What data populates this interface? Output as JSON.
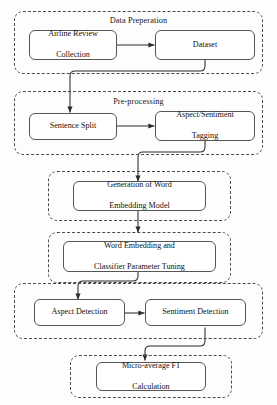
{
  "diagram": {
    "type": "flowchart",
    "orientation": "top-to-bottom",
    "groups": [
      {
        "id": "data-preparation",
        "label": "Data Preperation"
      },
      {
        "id": "pre-processing",
        "label": "Pre-processing"
      },
      {
        "id": "word-embedding-generation",
        "label": ""
      },
      {
        "id": "parameter-tuning",
        "label": ""
      },
      {
        "id": "detection",
        "label": ""
      },
      {
        "id": "evaluation",
        "label": ""
      }
    ],
    "nodes": [
      {
        "id": "airline-review-collection",
        "label": "Airline Review\nCollection",
        "line1": "Airline Review",
        "line2": "Collection"
      },
      {
        "id": "dataset",
        "label": "Dataset",
        "line1": "Dataset",
        "line2": ""
      },
      {
        "id": "sentence-split",
        "label": "Sentence Split",
        "line1": "Sentence Split",
        "line2": ""
      },
      {
        "id": "aspect-sentiment-tagging",
        "label": "Aspect/Sentiment Tagging",
        "line1": "Aspect/Sentiment",
        "line2": "Tagging"
      },
      {
        "id": "word-embedding-model",
        "label": "Generation of Word Embedding Model",
        "line1": "Generation of Word",
        "line2": "Embedding Model"
      },
      {
        "id": "classifier-parameter-tuning",
        "label": "Word Embedding and Classifier Parameter Tuning",
        "line1": "Word Embedding and",
        "line2": "Classifier Parameter Tuning"
      },
      {
        "id": "aspect-detection",
        "label": "Aspect Detection",
        "line1": "Aspect Detection",
        "line2": ""
      },
      {
        "id": "sentiment-detection",
        "label": "Sentiment Detection",
        "line1": "Sentiment Detection",
        "line2": ""
      },
      {
        "id": "micro-average-f1",
        "label": "Micro-average F1 Calculation",
        "line1": "Micro-average F1",
        "line2": "Calculation"
      }
    ],
    "edges": [
      {
        "from": "airline-review-collection",
        "to": "dataset",
        "style": "straight-horizontal"
      },
      {
        "from": "dataset",
        "to": "sentence-split",
        "style": "orthogonal-down-left-down"
      },
      {
        "from": "sentence-split",
        "to": "aspect-sentiment-tagging",
        "style": "straight-horizontal"
      },
      {
        "from": "aspect-sentiment-tagging",
        "to": "word-embedding-model",
        "style": "orthogonal-down-left-down"
      },
      {
        "from": "word-embedding-model",
        "to": "classifier-parameter-tuning",
        "style": "straight-vertical"
      },
      {
        "from": "classifier-parameter-tuning",
        "to": "aspect-detection",
        "style": "orthogonal-down-left-down"
      },
      {
        "from": "aspect-detection",
        "to": "sentiment-detection",
        "style": "straight-horizontal"
      },
      {
        "from": "sentiment-detection",
        "to": "micro-average-f1",
        "style": "orthogonal-down-left-down"
      }
    ],
    "colors": {
      "background": "#fdfdfd",
      "node_border": "#555555",
      "group_border": "#4a4a4a",
      "connector": "#2b2b2b",
      "text": "#101010"
    }
  }
}
